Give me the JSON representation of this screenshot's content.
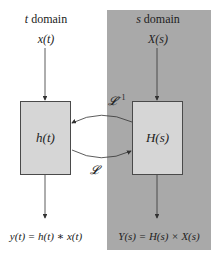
{
  "diagram": {
    "t_domain": {
      "heading_var": "t",
      "heading_text": " domain",
      "input": "x(t)",
      "block": "h(t)",
      "output": "y(t) = h(t) ∗ x(t)"
    },
    "s_domain": {
      "heading_var": "s",
      "heading_text": " domain",
      "input": "X(s)",
      "block": "H(s)",
      "output": "Y(s) = H(s) × X(s)"
    },
    "transforms": {
      "forward": "𝓛",
      "inverse": "𝓛",
      "inverse_sup": "−1"
    },
    "colors": {
      "s_panel": "#a9a9a9",
      "block_fill": "#d6d6d6",
      "line": "#333333"
    }
  }
}
